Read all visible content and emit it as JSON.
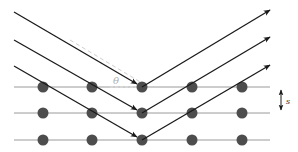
{
  "diagram": {
    "angle_label": "θ",
    "spacing_label": "s",
    "colors": {
      "background": "#ffffff",
      "ray": "#1a1a1a",
      "plane_line": "#9a9a9a",
      "atom": "#4d4d4d",
      "dashed_line": "#c8c8c8",
      "label": "#b0b0b0",
      "spacing_label": "#333333"
    },
    "planes": [
      {
        "y": 87
      },
      {
        "y": 113
      },
      {
        "y": 140
      }
    ],
    "atom_x": [
      43,
      92,
      142,
      192,
      242
    ],
    "incoming_rays": [
      {
        "x1": 14,
        "y1": 12,
        "x2": 142,
        "y2": 87
      },
      {
        "x1": 14,
        "y1": 40,
        "x2": 142,
        "y2": 113
      },
      {
        "x1": 14,
        "y1": 66,
        "x2": 142,
        "y2": 140
      }
    ],
    "outgoing_rays": [
      {
        "x1": 142,
        "y1": 87,
        "x2": 270,
        "y2": 10
      },
      {
        "x1": 142,
        "y1": 113,
        "x2": 270,
        "y2": 37
      },
      {
        "x1": 142,
        "y1": 140,
        "x2": 270,
        "y2": 65
      }
    ]
  }
}
